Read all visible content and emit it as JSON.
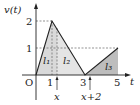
{
  "diagram": {
    "y_axis_label": "v(t)",
    "x_axis_label": "t",
    "origin_label": "O",
    "y_ticks": [
      "2",
      "1"
    ],
    "x_ticks": [
      "1",
      "3",
      "5"
    ],
    "region_labels": [
      "l₁",
      "l₂",
      "l₃"
    ],
    "markers": [
      "x",
      "x+2"
    ],
    "points": [
      [
        0,
        0
      ],
      [
        1,
        2
      ],
      [
        3,
        0
      ],
      [
        5,
        1
      ]
    ],
    "shade_light": "#dcdcdc",
    "shade_dark": "#bdbdbd"
  }
}
